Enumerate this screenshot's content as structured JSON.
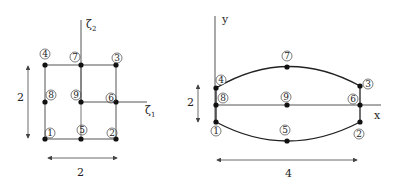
{
  "left_element": {
    "name": "parent square element",
    "axis_labels": {
      "horizontal": "ζ",
      "horizontal_sub": "1",
      "vertical": "ζ",
      "vertical_sub": "2"
    },
    "dimensions": {
      "height": "2",
      "width": "2"
    },
    "nodes": [
      {
        "id": "1",
        "label": "1",
        "x": 45,
        "y": 139
      },
      {
        "id": "2",
        "label": "2",
        "x": 116,
        "y": 139
      },
      {
        "id": "3",
        "label": "3",
        "x": 116,
        "y": 65
      },
      {
        "id": "4",
        "label": "4",
        "x": 45,
        "y": 65
      },
      {
        "id": "5",
        "label": "5",
        "x": 81,
        "y": 139
      },
      {
        "id": "6",
        "label": "6",
        "x": 116,
        "y": 102
      },
      {
        "id": "7",
        "label": "7",
        "x": 81,
        "y": 65
      },
      {
        "id": "8",
        "label": "8",
        "x": 45,
        "y": 102
      },
      {
        "id": "9",
        "label": "9",
        "x": 81,
        "y": 102
      }
    ]
  },
  "right_element": {
    "name": "mapped curved element",
    "axis_labels": {
      "horizontal": "x",
      "vertical": "y"
    },
    "dimensions": {
      "height": "2",
      "width": "4"
    },
    "nodes": [
      {
        "id": "1",
        "label": "1",
        "x": 216,
        "y": 122
      },
      {
        "id": "2",
        "label": "2",
        "x": 360,
        "y": 122
      },
      {
        "id": "3",
        "label": "3",
        "x": 360,
        "y": 86
      },
      {
        "id": "4",
        "label": "4",
        "x": 216,
        "y": 88
      },
      {
        "id": "5",
        "label": "5",
        "x": 287,
        "y": 141
      },
      {
        "id": "6",
        "label": "6",
        "x": 360,
        "y": 105
      },
      {
        "id": "7",
        "label": "7",
        "x": 287,
        "y": 67
      },
      {
        "id": "8",
        "label": "8",
        "x": 216,
        "y": 105
      },
      {
        "id": "9",
        "label": "9",
        "x": 287,
        "y": 105
      }
    ]
  }
}
